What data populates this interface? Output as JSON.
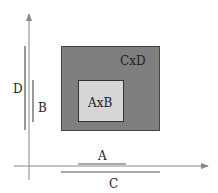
{
  "diagram": {
    "outer_rect": {
      "label": "CxD",
      "fill": "#7f7f7f",
      "stroke": "#444444"
    },
    "inner_rect": {
      "label": "AxB",
      "fill": "#d6d6d6",
      "stroke": "#333333"
    },
    "dimension_labels": {
      "horizontal_short": "A",
      "vertical_short": "B",
      "horizontal_long": "C",
      "vertical_long": "D"
    },
    "axes": {
      "color": "#888888"
    }
  }
}
